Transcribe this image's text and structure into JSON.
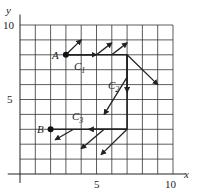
{
  "figure": {
    "axes": {
      "x_label": "x",
      "y_label": "y",
      "x_ticks": [
        {
          "value": 5,
          "label": "5"
        },
        {
          "value": 10,
          "label": "10"
        }
      ],
      "y_ticks": [
        {
          "value": 5,
          "label": "5"
        },
        {
          "value": 10,
          "label": "10"
        }
      ],
      "x_range": [
        0,
        10
      ],
      "y_range": [
        0,
        10
      ],
      "grid": true,
      "grid_step": 1
    },
    "points": [
      {
        "name": "A",
        "x": 3,
        "y": 8
      },
      {
        "name": "B",
        "x": 2,
        "y": 3
      }
    ],
    "curves": [
      {
        "name": "C1",
        "label_main": "C",
        "label_sub": "1",
        "from": [
          3,
          8
        ],
        "to": [
          7,
          8
        ]
      },
      {
        "name": "C2",
        "label_main": "C",
        "label_sub": "2",
        "from": [
          7,
          8
        ],
        "to": [
          7,
          3
        ]
      },
      {
        "name": "C3",
        "label_main": "C",
        "label_sub": "3",
        "from": [
          7,
          3
        ],
        "to": [
          2,
          3
        ]
      }
    ],
    "vectors": [
      {
        "from": [
          3,
          8
        ],
        "to": [
          4,
          9
        ]
      },
      {
        "from": [
          5,
          8
        ],
        "to": [
          6,
          8.8
        ]
      },
      {
        "from": [
          6,
          8
        ],
        "to": [
          7,
          8.8
        ]
      },
      {
        "from": [
          7,
          8
        ],
        "to": [
          9,
          6
        ]
      },
      {
        "from": [
          7,
          6.5
        ],
        "to": [
          5.5,
          4
        ]
      },
      {
        "from": [
          7,
          3
        ],
        "to": [
          5.3,
          1.3
        ]
      },
      {
        "from": [
          5.5,
          3
        ],
        "to": [
          4,
          1.7
        ]
      },
      {
        "from": [
          3.5,
          3
        ],
        "to": [
          2.3,
          2.3
        ]
      }
    ],
    "colors": {
      "line": "#222222",
      "grid": "#333333",
      "background": "#ffffff"
    }
  }
}
